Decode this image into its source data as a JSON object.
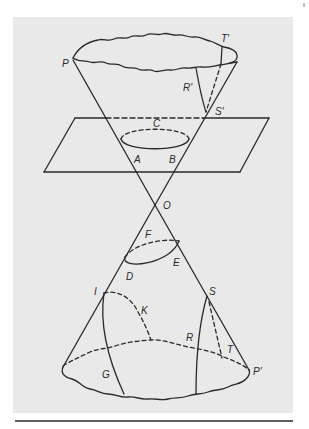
{
  "figure": {
    "type": "double-cone conic sections",
    "colors": {
      "panel": "#e9e9e9",
      "stroke": "#2a2a2a",
      "page": "#ffffff"
    },
    "labels": {
      "P": "P",
      "T_prime": "T'",
      "R_prime": "R'",
      "S_prime": "S'",
      "C": "C",
      "A": "A",
      "B": "B",
      "O": "O",
      "F": "F",
      "D": "D",
      "E": "E",
      "I": "I",
      "K": "K",
      "S": "S",
      "R": "R",
      "T": "T",
      "G": "G",
      "P_prime": "P'"
    }
  }
}
